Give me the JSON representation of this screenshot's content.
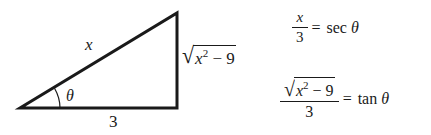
{
  "diagram": {
    "triangle": {
      "vertices": {
        "left": [
          20,
          108
        ],
        "right_angle": [
          177,
          108
        ],
        "top": [
          177,
          13
        ]
      },
      "stroke_color": "#1a1a1a",
      "hypotenuse_label": "x",
      "adjacent_label": "3",
      "opposite_label": {
        "radical": "√",
        "base": "x",
        "exponent": "2",
        "rest": " − 9"
      },
      "angle_label": "θ"
    },
    "equations": [
      {
        "id": "sec",
        "numerator": "x",
        "denominator": "3",
        "equals": "=",
        "rhs_func": "sec",
        "rhs_var": "θ"
      },
      {
        "id": "tan",
        "numerator": {
          "radical": "√",
          "base": "x",
          "exponent": "2",
          "rest": " − 9"
        },
        "denominator": "3",
        "equals": "=",
        "rhs_func": "tan",
        "rhs_var": "θ"
      }
    ]
  }
}
